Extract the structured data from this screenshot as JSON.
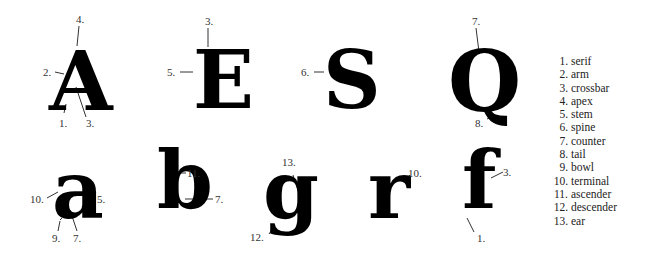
{
  "glyphs": {
    "A": "A",
    "E": "E",
    "S": "S",
    "Q": "Q",
    "a": "a",
    "b": "b",
    "g": "g",
    "r": "r",
    "f": "f"
  },
  "callouts": {
    "A": [
      "4.",
      "2.",
      "1.",
      "3."
    ],
    "E": [
      "3.",
      "5."
    ],
    "S": [
      "6."
    ],
    "Q": [
      "7.",
      "8."
    ],
    "a": [
      "10.",
      "5.",
      "9.",
      "7."
    ],
    "b": [
      "11.",
      "7."
    ],
    "g": [
      "13.",
      "12."
    ],
    "r": [
      "10."
    ],
    "f": [
      "3.",
      "1."
    ]
  },
  "legend": [
    {
      "num": "1.",
      "term": "serif"
    },
    {
      "num": "2.",
      "term": "arm"
    },
    {
      "num": "3.",
      "term": "crossbar"
    },
    {
      "num": "4.",
      "term": "apex"
    },
    {
      "num": "5.",
      "term": "stem"
    },
    {
      "num": "6.",
      "term": "spine"
    },
    {
      "num": "7.",
      "term": "counter"
    },
    {
      "num": "8.",
      "term": "tail"
    },
    {
      "num": "9.",
      "term": "bowl"
    },
    {
      "num": "10.",
      "term": "terminal"
    },
    {
      "num": "11.",
      "term": "ascender"
    },
    {
      "num": "12.",
      "term": "descender"
    },
    {
      "num": "13.",
      "term": "ear"
    }
  ]
}
